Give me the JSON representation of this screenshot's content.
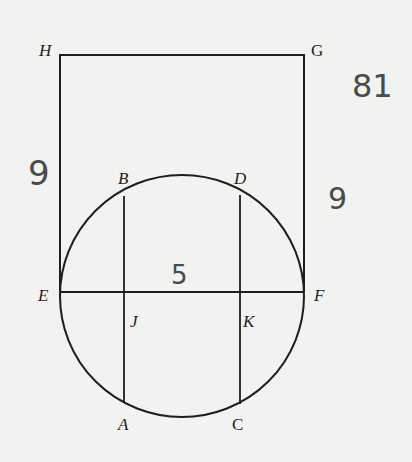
{
  "diagram": {
    "type": "geometry",
    "shapes": {
      "rectangle": {
        "vertices": [
          "H",
          "G",
          "F",
          "E"
        ]
      },
      "circle": {
        "diameter": "EF"
      },
      "chords": [
        "BA",
        "DC"
      ],
      "segment": "EF"
    },
    "points": {
      "H": "H",
      "G": "G",
      "B": "B",
      "D": "D",
      "E": "E",
      "F": "F",
      "J": "J",
      "K": "K",
      "A": "A",
      "C": "C"
    },
    "annotations": {
      "left_side": "9",
      "right_side": "9",
      "area": "81",
      "diameter": "5"
    },
    "colors": {
      "line": "#1e1e1e",
      "handwriting": "#4a4a4a",
      "background": "#f2f2f0"
    }
  }
}
